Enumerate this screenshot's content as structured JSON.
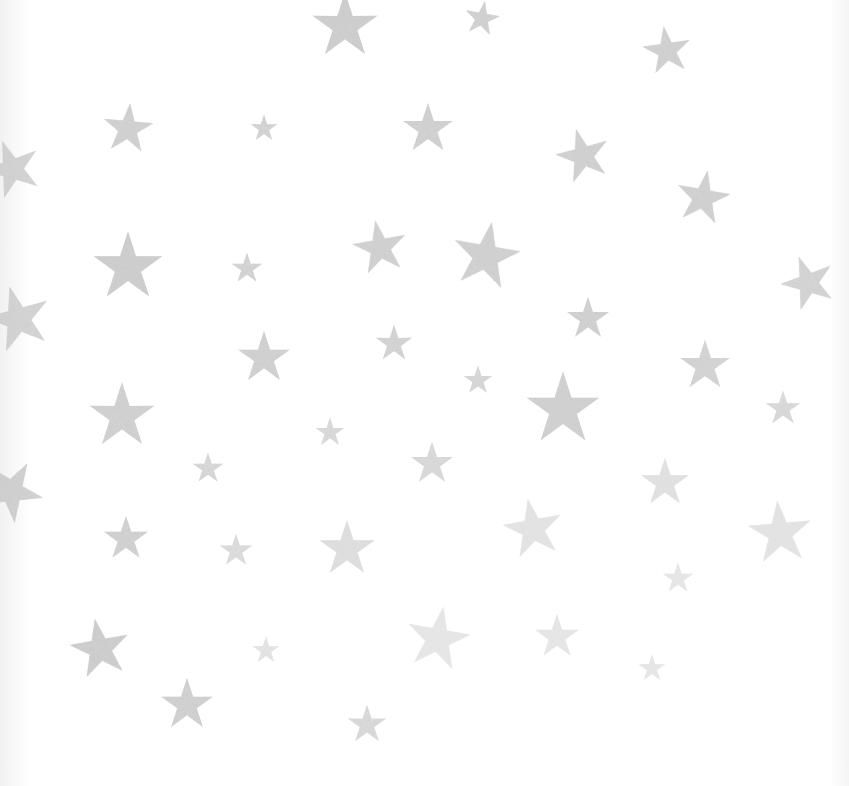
{
  "image": {
    "description": "Glittery silver five-pointed stars scattered on a white background",
    "background_color": "#ffffff",
    "star_color_dark": "#8f8f8f",
    "star_color_light": "#cfcfcf"
  },
  "stars": [
    {
      "x": 345,
      "y": 25,
      "s": 68,
      "r": 0,
      "o": 0.9
    },
    {
      "x": 482,
      "y": 18,
      "s": 36,
      "r": 10,
      "o": 0.85
    },
    {
      "x": 667,
      "y": 50,
      "s": 50,
      "r": -8,
      "o": 0.85
    },
    {
      "x": 128,
      "y": 128,
      "s": 52,
      "r": 5,
      "o": 0.85
    },
    {
      "x": 264,
      "y": 128,
      "s": 28,
      "r": 0,
      "o": 0.8
    },
    {
      "x": 428,
      "y": 128,
      "s": 52,
      "r": 0,
      "o": 0.85
    },
    {
      "x": 583,
      "y": 155,
      "s": 56,
      "r": -15,
      "o": 0.85
    },
    {
      "x": 12,
      "y": 168,
      "s": 60,
      "r": -20,
      "o": 0.8
    },
    {
      "x": 703,
      "y": 197,
      "s": 56,
      "r": 10,
      "o": 0.85
    },
    {
      "x": 128,
      "y": 266,
      "s": 72,
      "r": 0,
      "o": 0.9
    },
    {
      "x": 247,
      "y": 268,
      "s": 32,
      "r": 0,
      "o": 0.8
    },
    {
      "x": 380,
      "y": 247,
      "s": 56,
      "r": -10,
      "o": 0.85
    },
    {
      "x": 486,
      "y": 255,
      "s": 70,
      "r": 10,
      "o": 0.85
    },
    {
      "x": 808,
      "y": 282,
      "s": 56,
      "r": -20,
      "o": 0.8
    },
    {
      "x": 18,
      "y": 318,
      "s": 68,
      "r": -15,
      "o": 0.8
    },
    {
      "x": 588,
      "y": 318,
      "s": 44,
      "r": 0,
      "o": 0.85
    },
    {
      "x": 264,
      "y": 357,
      "s": 54,
      "r": 0,
      "o": 0.85
    },
    {
      "x": 394,
      "y": 343,
      "s": 38,
      "r": 0,
      "o": 0.8
    },
    {
      "x": 705,
      "y": 365,
      "s": 52,
      "r": 0,
      "o": 0.8
    },
    {
      "x": 478,
      "y": 380,
      "s": 30,
      "r": 0,
      "o": 0.75
    },
    {
      "x": 563,
      "y": 408,
      "s": 76,
      "r": 0,
      "o": 0.85
    },
    {
      "x": 122,
      "y": 415,
      "s": 68,
      "r": 0,
      "o": 0.85
    },
    {
      "x": 783,
      "y": 408,
      "s": 36,
      "r": 0,
      "o": 0.7
    },
    {
      "x": 330,
      "y": 432,
      "s": 30,
      "r": 0,
      "o": 0.7
    },
    {
      "x": 432,
      "y": 463,
      "s": 44,
      "r": 0,
      "o": 0.7
    },
    {
      "x": 208,
      "y": 468,
      "s": 32,
      "r": 0,
      "o": 0.75
    },
    {
      "x": 665,
      "y": 482,
      "s": 50,
      "r": 0,
      "o": 0.55
    },
    {
      "x": 12,
      "y": 490,
      "s": 64,
      "r": 30,
      "o": 0.85
    },
    {
      "x": 533,
      "y": 528,
      "s": 62,
      "r": -10,
      "o": 0.5
    },
    {
      "x": 780,
      "y": 532,
      "s": 66,
      "r": -5,
      "o": 0.5
    },
    {
      "x": 126,
      "y": 538,
      "s": 46,
      "r": 0,
      "o": 0.85
    },
    {
      "x": 236,
      "y": 550,
      "s": 34,
      "r": 0,
      "o": 0.65
    },
    {
      "x": 347,
      "y": 548,
      "s": 58,
      "r": 0,
      "o": 0.6
    },
    {
      "x": 678,
      "y": 578,
      "s": 32,
      "r": 0,
      "o": 0.45
    },
    {
      "x": 100,
      "y": 648,
      "s": 62,
      "r": -10,
      "o": 0.9
    },
    {
      "x": 438,
      "y": 638,
      "s": 66,
      "r": 10,
      "o": 0.45
    },
    {
      "x": 557,
      "y": 636,
      "s": 46,
      "r": 0,
      "o": 0.45
    },
    {
      "x": 266,
      "y": 650,
      "s": 28,
      "r": 0,
      "o": 0.5
    },
    {
      "x": 652,
      "y": 668,
      "s": 28,
      "r": 0,
      "o": 0.45
    },
    {
      "x": 187,
      "y": 704,
      "s": 54,
      "r": 0,
      "o": 0.85
    },
    {
      "x": 367,
      "y": 724,
      "s": 40,
      "r": 0,
      "o": 0.7
    }
  ]
}
